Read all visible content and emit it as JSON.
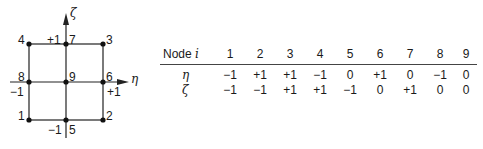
{
  "diagram": {
    "axes": {
      "vertical": "ζ",
      "horizontal": "η"
    },
    "nodes": [
      {
        "id": "1",
        "x": 29,
        "y": 120
      },
      {
        "id": "2",
        "x": 103,
        "y": 120
      },
      {
        "id": "3",
        "x": 103,
        "y": 44
      },
      {
        "id": "4",
        "x": 29,
        "y": 44
      },
      {
        "id": "5",
        "x": 66,
        "y": 120
      },
      {
        "id": "6",
        "x": 103,
        "y": 82
      },
      {
        "id": "7",
        "x": 66,
        "y": 44
      },
      {
        "id": "8",
        "x": 29,
        "y": 82
      },
      {
        "id": "9",
        "x": 66,
        "y": 82
      }
    ],
    "tick_labels": {
      "top": "+1",
      "bottom": "−1",
      "left": "−1",
      "right": "+1"
    }
  },
  "table": {
    "header_label": "Node",
    "header_var": "i",
    "columns": [
      "1",
      "2",
      "3",
      "4",
      "5",
      "6",
      "7",
      "8",
      "9"
    ],
    "rows": [
      {
        "var": "η",
        "values": [
          "−1",
          "+1",
          "+1",
          "−1",
          "0",
          "+1",
          "0",
          "−1",
          "0"
        ]
      },
      {
        "var": "ζ",
        "values": [
          "−1",
          "−1",
          "+1",
          "+1",
          "−1",
          "0",
          "+1",
          "0",
          "0"
        ]
      }
    ]
  }
}
